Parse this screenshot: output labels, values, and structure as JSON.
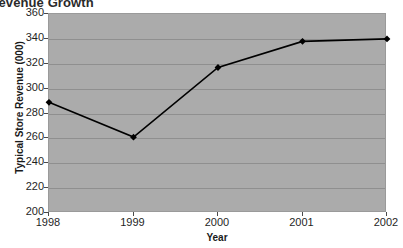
{
  "chart_data": {
    "type": "line",
    "title": "e Revenue Growth",
    "title_note": "title is cropped at the top edge of the screenshot",
    "xlabel": "Year",
    "ylabel": "Typical Store Revenue  (000)",
    "categories": [
      "1998",
      "1999",
      "2000",
      "2001",
      "2002"
    ],
    "values": [
      289,
      261,
      317,
      338,
      340
    ],
    "series": [
      {
        "name": "Typical Store Revenue (000)",
        "values": [
          289,
          261,
          317,
          338,
          340
        ]
      }
    ],
    "ylim": [
      200,
      360
    ],
    "ytick_step": 20,
    "yticks": [
      "360",
      "340",
      "320",
      "300",
      "280",
      "260",
      "240",
      "220",
      "200"
    ],
    "ytick_values": [
      360,
      340,
      320,
      300,
      280,
      260,
      240,
      220,
      200
    ],
    "grid": "horizontal",
    "legend": "none",
    "marker": "diamond",
    "colors": {
      "plot_background": "#ababab",
      "gridline": "#8f8f8f",
      "series_line": "#000000",
      "marker_fill": "#000000",
      "page_background": "#ffffff",
      "text": "#1a1a1a"
    }
  }
}
